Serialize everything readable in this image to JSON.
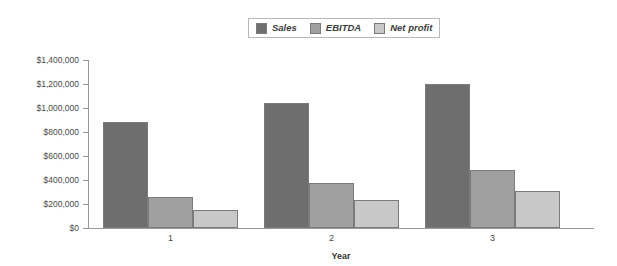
{
  "chart_data": {
    "type": "bar",
    "title": "",
    "xlabel": "Year",
    "ylabel": "",
    "categories": [
      "1",
      "2",
      "3"
    ],
    "series": [
      {
        "name": "Sales",
        "color": "#6e6e6e",
        "values": [
          883000,
          1042000,
          1200000
        ]
      },
      {
        "name": "EBITDA",
        "color": "#a0a0a0",
        "values": [
          258000,
          375000,
          483000
        ]
      },
      {
        "name": "Net profit",
        "color": "#c8c8c8",
        "values": [
          150000,
          233000,
          308000
        ]
      }
    ],
    "ylim": [
      0,
      1400000
    ],
    "ytick_values": [
      0,
      200000,
      400000,
      600000,
      800000,
      1000000,
      1200000,
      1400000
    ],
    "ytick_labels": [
      "$0",
      "$200,000",
      "$400,000",
      "$600,000",
      "$800,000",
      "$1,000,000",
      "$1,200,000",
      "$1,400,000"
    ],
    "grid": false,
    "legend_position": "top-center",
    "bar_border_color": "#7b7b7b",
    "axis_color": "#9a9a9a",
    "background": "#ffffff"
  }
}
